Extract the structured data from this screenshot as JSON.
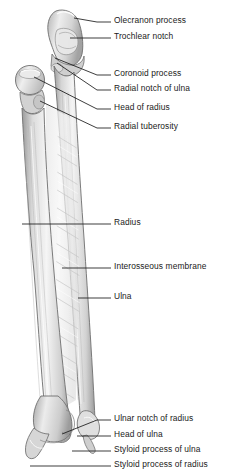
{
  "figure": {
    "background_color": "#ffffff",
    "bone_fill_light": "#f2f2f2",
    "bone_fill_mid": "#d9d9d9",
    "bone_fill_dark": "#a9a9a9",
    "outline_color": "#6e6e6e",
    "leader_color": "#1a1a1a",
    "label_color": "#1a1a1a"
  },
  "labels": [
    {
      "id": "olecranon-process",
      "text": "Olecranon process",
      "text_x": 114,
      "text_y": 22,
      "leader_x1": 97,
      "leader_y1": 22,
      "leader_x2": 74,
      "leader_y2": 18
    },
    {
      "id": "trochlear-notch",
      "text": "Trochlear notch",
      "text_x": 114,
      "text_y": 38,
      "leader_x1": 97,
      "leader_y1": 38,
      "leader_x2": 70,
      "leader_y2": 38
    },
    {
      "id": "coronoid-process",
      "text": "Coronoid process",
      "text_x": 114,
      "text_y": 75,
      "leader_x1": 97,
      "leader_y1": 75,
      "leader_x2": 55,
      "leader_y2": 58
    },
    {
      "id": "radial-notch-of-ulna",
      "text": "Radial notch of ulna",
      "text_x": 114,
      "text_y": 90,
      "leader_x1": 97,
      "leader_y1": 90,
      "leader_x2": 57,
      "leader_y2": 63
    },
    {
      "id": "head-of-radius",
      "text": "Head of radius",
      "text_x": 114,
      "text_y": 109,
      "leader_x1": 97,
      "leader_y1": 109,
      "leader_x2": 34,
      "leader_y2": 77
    },
    {
      "id": "radial-tuberosity",
      "text": "Radial tuberosity",
      "text_x": 114,
      "text_y": 128,
      "leader_x1": 97,
      "leader_y1": 128,
      "leader_x2": 40,
      "leader_y2": 101
    },
    {
      "id": "radius",
      "text": "Radius",
      "text_x": 114,
      "text_y": 224,
      "leader_x1": 97,
      "leader_y1": 224,
      "leader_x2": 22,
      "leader_y2": 224
    },
    {
      "id": "interosseous-membrane",
      "text": "Interosseous membrane",
      "text_x": 114,
      "text_y": 268,
      "leader_x1": 97,
      "leader_y1": 268,
      "leader_x2": 62,
      "leader_y2": 268
    },
    {
      "id": "ulna",
      "text": "Ulna",
      "text_x": 114,
      "text_y": 298,
      "leader_x1": 97,
      "leader_y1": 298,
      "leader_x2": 78,
      "leader_y2": 298
    },
    {
      "id": "ulnar-notch-of-radius",
      "text": "Ulnar notch of radius",
      "text_x": 114,
      "text_y": 420,
      "leader_x1": 97,
      "leader_y1": 420,
      "leader_x2": 62,
      "leader_y2": 434
    },
    {
      "id": "head-of-ulna",
      "text": "Head of ulna",
      "text_x": 114,
      "text_y": 436,
      "leader_x1": 97,
      "leader_y1": 436,
      "leader_x2": 77,
      "leader_y2": 436
    },
    {
      "id": "styloid-process-of-ulna",
      "text": "Styloid process of ulna",
      "text_x": 114,
      "text_y": 451,
      "leader_x1": 97,
      "leader_y1": 451,
      "leader_x2": 72,
      "leader_y2": 451
    },
    {
      "id": "styloid-process-of-radius",
      "text": "Styloid process of radius",
      "text_x": 114,
      "text_y": 466,
      "leader_x1": 97,
      "leader_y1": 466,
      "leader_x2": 30,
      "leader_y2": 466
    }
  ],
  "structures": [
    {
      "id": "ulna-bone",
      "name": "Ulna"
    },
    {
      "id": "radius-bone",
      "name": "Radius"
    },
    {
      "id": "interosseous-membrane-fibers",
      "name": "Interosseous membrane"
    }
  ]
}
